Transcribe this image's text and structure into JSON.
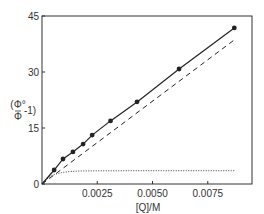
{
  "chart_data": {
    "type": "line",
    "title": "",
    "xlabel": "[Q]/M",
    "ylabel": "(Φ°/Φ − 1)",
    "xlim": [
      0,
      0.0095
    ],
    "ylim": [
      0,
      45
    ],
    "grid": false,
    "legend": null,
    "xticks": [
      0.0025,
      0.005,
      0.0075
    ],
    "xtick_labels": [
      "0.0025",
      "0.0050",
      "0.0075"
    ],
    "yticks": [
      0,
      15,
      30,
      45
    ],
    "ytick_labels": [
      "0",
      "15",
      "30",
      "45"
    ],
    "series": [
      {
        "name": "experimental (solid, filled circles)",
        "style": "solid",
        "markers": true,
        "x": [
          0,
          0.00055,
          0.00095,
          0.0014,
          0.00186,
          0.00227,
          0.0031,
          0.0043,
          0.0062,
          0.0087
        ],
        "y": [
          0,
          3.75,
          6.7,
          8.6,
          10.7,
          13.1,
          16.9,
          22.0,
          30.8,
          41.8
        ]
      },
      {
        "name": "linear component (dashed)",
        "style": "dashed",
        "markers": false,
        "x": [
          0,
          0.0087
        ],
        "y": [
          0,
          38.6
        ]
      },
      {
        "name": "saturating component (dotted)",
        "style": "dotted",
        "markers": false,
        "x": [
          0,
          0.0003,
          0.0008,
          0.0015,
          0.0025,
          0.004,
          0.006,
          0.0087
        ],
        "y": [
          0,
          1.6,
          2.6,
          3.0,
          3.2,
          3.35,
          3.45,
          3.5
        ]
      }
    ],
    "colors": {
      "line": "#222222",
      "axis": "#333333",
      "background": "#ffffff"
    }
  }
}
